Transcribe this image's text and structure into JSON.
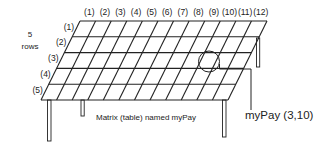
{
  "diagram": {
    "title": "Matrix (table) named myPay",
    "matrix_name": "myPay",
    "rows_count_label": "5",
    "rows_word": "rows",
    "column_labels": [
      "(1)",
      "(2)",
      "(3)",
      "(4)",
      "(5)",
      "(6)",
      "(7)",
      "(8)",
      "(9)",
      "(10)",
      "(11)",
      "(12)"
    ],
    "row_labels": [
      "(1)",
      "(2)",
      "(3)",
      "(4)",
      "(5)"
    ],
    "caption": "Matrix (table) named myPay",
    "highlighted_cell": {
      "row": 3,
      "column": 10,
      "label": "myPay (3,10)"
    },
    "colors": {
      "line": "#222222",
      "background": "#ffffff",
      "text": "#222222"
    }
  }
}
